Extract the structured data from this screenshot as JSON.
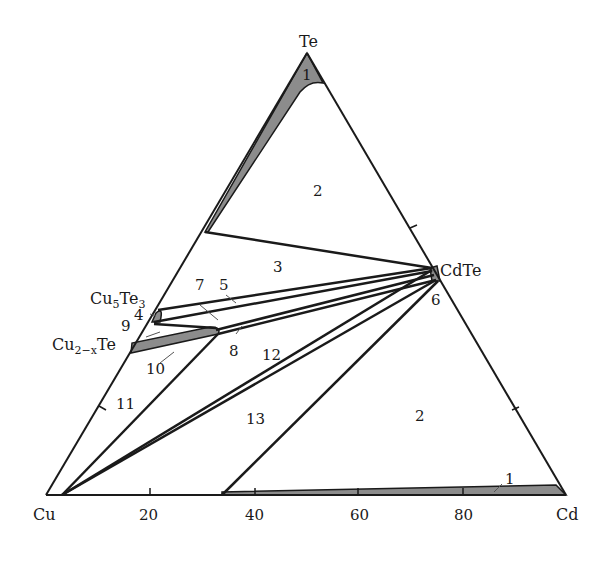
{
  "diagram": {
    "type": "ternary-phase-diagram",
    "vertices": {
      "top": "Te",
      "left": "Cu",
      "right": "Cd"
    },
    "compounds": {
      "cdte": "CdTe",
      "cu5te3": {
        "base1": "Cu",
        "sub1": "5",
        "base2": "Te",
        "sub2": "3"
      },
      "cu2xte": {
        "base1": "Cu",
        "sub1": "2−x",
        "base2": "Te"
      }
    },
    "bottom_axis_ticks": [
      "20",
      "40",
      "60",
      "80"
    ],
    "region_labels": {
      "r1_top": "1",
      "r1_bottom": "1",
      "r2_upper": "2",
      "r2_lower": "2",
      "r3": "3",
      "r4": "4",
      "r5": "5",
      "r6": "6",
      "r7": "7",
      "r8": "8",
      "r9": "9",
      "r10": "10",
      "r11": "11",
      "r12": "12",
      "r13": "13"
    },
    "colors": {
      "line": "#1a1a1a",
      "shaded": "#8c8c8c",
      "background": "#ffffff"
    }
  }
}
